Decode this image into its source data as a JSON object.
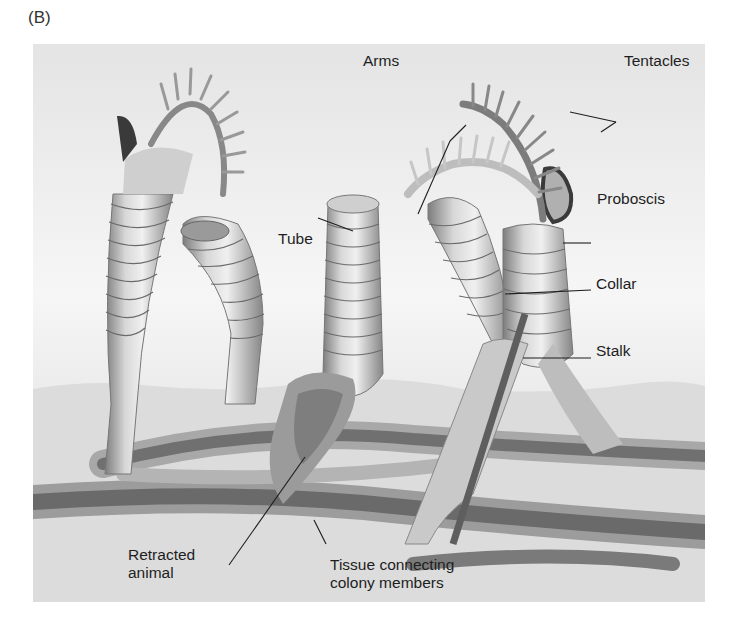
{
  "panel_label": "(B)",
  "figure": {
    "labels": {
      "arms": "Arms",
      "tentacles": "Tentacles",
      "proboscis": "Proboscis",
      "tube": "Tube",
      "collar": "Collar",
      "stalk": "Stalk",
      "retracted_animal_line1": "Retracted",
      "retracted_animal_line2": "animal",
      "tissue_line1": "Tissue connecting",
      "tissue_line2": "colony members"
    },
    "colors": {
      "background_top": "#e6e6e6",
      "background_mid": "#f4f4f4",
      "ground": "#d9d9d9",
      "tube_light": "#e8e8e8",
      "tube_dark": "#8a8a8a",
      "stolon_dark": "#6e6e6e",
      "label_text": "#1e1e1e"
    }
  }
}
